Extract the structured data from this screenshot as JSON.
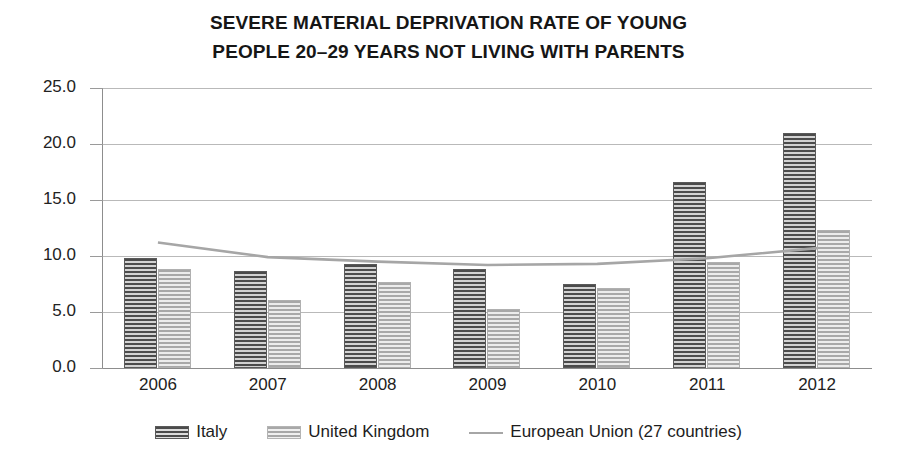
{
  "chart_data": {
    "type": "bar",
    "title": "SEVERE MATERIAL DEPRIVATION RATE OF YOUNG PEOPLE  20–29 YEARS NOT LIVING WITH PARENTS",
    "title_line1": "SEVERE MATERIAL DEPRIVATION RATE OF YOUNG",
    "title_line2": "PEOPLE  20–29 YEARS NOT LIVING WITH PARENTS",
    "xlabel": "",
    "ylabel": "",
    "categories": [
      "2006",
      "2007",
      "2008",
      "2009",
      "2010",
      "2011",
      "2012"
    ],
    "ylim": [
      0.0,
      25.0
    ],
    "ytick_labels": [
      "0.0",
      "5.0",
      "10.0",
      "15.0",
      "20.0",
      "25.0"
    ],
    "ytick_values": [
      0.0,
      5.0,
      10.0,
      15.0,
      20.0,
      25.0
    ],
    "grid": true,
    "legend_position": "bottom",
    "series": [
      {
        "name": "Italy",
        "type": "bar",
        "color": "#4b4b4b",
        "pattern": "horizontal-stripes-dark",
        "values": [
          9.8,
          8.7,
          9.3,
          8.8,
          7.5,
          16.6,
          21.0
        ]
      },
      {
        "name": "United Kingdom",
        "type": "bar",
        "color": "#a8a8a8",
        "pattern": "horizontal-stripes-light",
        "values": [
          8.8,
          6.1,
          7.7,
          5.3,
          7.1,
          9.5,
          12.3
        ]
      },
      {
        "name": "European Union (27 countries)",
        "type": "line",
        "color": "#a6a6a6",
        "values": [
          11.2,
          9.9,
          9.5,
          9.2,
          9.3,
          9.8,
          10.7
        ]
      }
    ]
  },
  "axis": {
    "y_labels": [
      "25.0",
      "20.0",
      "15.0",
      "10.0",
      "5.0",
      "0.0"
    ],
    "x_labels": [
      "2006",
      "2007",
      "2008",
      "2009",
      "2010",
      "2011",
      "2012"
    ]
  },
  "legend": {
    "items": [
      {
        "label": "Italy",
        "swatch": "italy-striped-swatch"
      },
      {
        "label": "United Kingdom",
        "swatch": "uk-striped-swatch"
      },
      {
        "label": "European Union (27 countries)",
        "swatch": "eu-line-swatch"
      }
    ]
  },
  "colors": {
    "italy": "#4b4b4b",
    "uk": "#a8a8a8",
    "eu_line": "#a6a6a6",
    "gridline": "#b9b9b9",
    "axis": "#8d8d8d",
    "text": "#1a1a1a",
    "background": "#ffffff"
  }
}
